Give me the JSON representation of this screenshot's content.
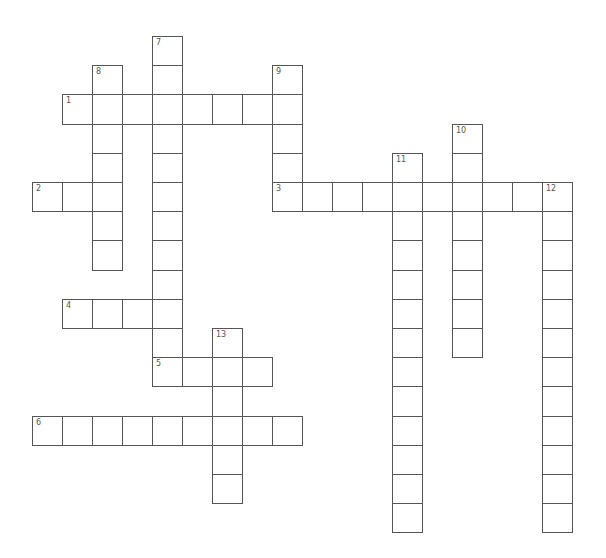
{
  "puzzle": {
    "origin_x": 32,
    "origin_y": 36,
    "cell_w": 30,
    "cell_h": 29.2,
    "border_color": "#555555",
    "background": "#ffffff"
  },
  "words": [
    {
      "number": "1",
      "direction": "across",
      "row": 2,
      "col": 1,
      "length": 8
    },
    {
      "number": "2",
      "direction": "across",
      "row": 5,
      "col": 0,
      "length": 3
    },
    {
      "number": "3",
      "direction": "across",
      "row": 5,
      "col": 8,
      "length": 10
    },
    {
      "number": "4",
      "direction": "across",
      "row": 9,
      "col": 1,
      "length": 4
    },
    {
      "number": "5",
      "direction": "across",
      "row": 11,
      "col": 4,
      "length": 4
    },
    {
      "number": "6",
      "direction": "across",
      "row": 13,
      "col": 0,
      "length": 9
    },
    {
      "number": "7",
      "direction": "down",
      "row": 0,
      "col": 4,
      "length": 12
    },
    {
      "number": "8",
      "direction": "down",
      "row": 1,
      "col": 2,
      "length": 7
    },
    {
      "number": "9",
      "direction": "down",
      "row": 1,
      "col": 8,
      "length": 5
    },
    {
      "number": "10",
      "direction": "down",
      "row": 3,
      "col": 14,
      "length": 8
    },
    {
      "number": "11",
      "direction": "down",
      "row": 4,
      "col": 12,
      "length": 13
    },
    {
      "number": "12",
      "direction": "down",
      "row": 5,
      "col": 17,
      "length": 12
    },
    {
      "number": "13",
      "direction": "down",
      "row": 10,
      "col": 6,
      "length": 6
    }
  ]
}
